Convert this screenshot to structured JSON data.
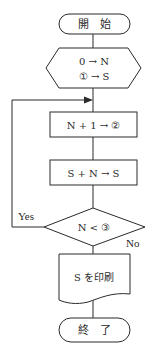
{
  "flowchart": {
    "start": {
      "label": "開　始"
    },
    "init": {
      "line1": "0 → N",
      "line2": "① → S"
    },
    "step1": {
      "label": "N + 1 → ②"
    },
    "step2": {
      "label": "S + N → S"
    },
    "decision": {
      "label": "N < ③",
      "yes_label": "Yes",
      "no_label": "No"
    },
    "output": {
      "label": "S を印刷"
    },
    "end": {
      "label": "終　了"
    }
  }
}
